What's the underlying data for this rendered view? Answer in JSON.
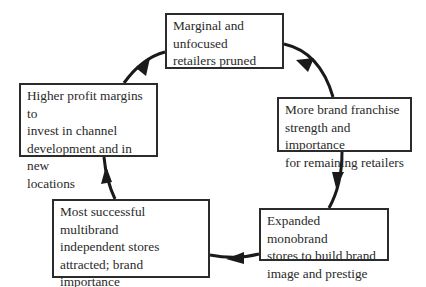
{
  "diagram": {
    "type": "cycle",
    "direction": "clockwise",
    "nodes": [
      {
        "id": "n1",
        "text": "Marginal and\nunfocused\nretailers pruned"
      },
      {
        "id": "n2",
        "text": "More brand franchise\nstrength and importance\nfor remaining retailers"
      },
      {
        "id": "n3",
        "text": "Expanded monobrand\nstores to build brand\nimage and prestige"
      },
      {
        "id": "n4",
        "text": "Most successful multibrand\nindependent stores\nattracted; brand importance\nbuilt with duty-free shops"
      },
      {
        "id": "n5",
        "text": "Higher profit margins to\ninvest in channel\ndevelopment and in new\nlocations"
      }
    ],
    "edges": [
      {
        "from": "n1",
        "to": "n2"
      },
      {
        "from": "n2",
        "to": "n3"
      },
      {
        "from": "n3",
        "to": "n4"
      },
      {
        "from": "n4",
        "to": "n5"
      },
      {
        "from": "n5",
        "to": "n1"
      }
    ],
    "colors": {
      "line": "#1a1a1a",
      "box_border": "#2b2b2b",
      "text": "#2a2a2a",
      "background": "#ffffff"
    }
  }
}
